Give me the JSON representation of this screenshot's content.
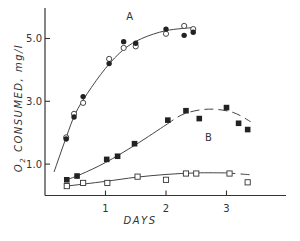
{
  "chart_data": {
    "type": "scatter",
    "title": "",
    "xlabel": "DAYS",
    "ylabel": "O2 CONSUMED, mg/l",
    "ylabel_parts": {
      "o": "O",
      "sub": "2",
      "rest": " CONSUMED,  mg/l"
    },
    "xlim": [
      0,
      4
    ],
    "ylim": [
      0,
      6
    ],
    "xticks": [
      1,
      2,
      3
    ],
    "xtick_labels": [
      "1",
      "2",
      "3"
    ],
    "yticks": [
      1.0,
      3.0,
      5.0
    ],
    "ytick_labels": [
      "1.0",
      "3.0",
      "5.0"
    ],
    "grid": false,
    "legend": "none",
    "annotations": [
      {
        "text": "A",
        "x": 1.4,
        "y": 5.6
      },
      {
        "text": "B",
        "x": 2.7,
        "y": 1.75
      }
    ],
    "series": [
      {
        "name": "A (open circles)",
        "marker": "open-circle",
        "points": [
          [
            0.35,
            1.85
          ],
          [
            0.48,
            2.6
          ],
          [
            0.63,
            2.95
          ],
          [
            1.06,
            4.35
          ],
          [
            1.3,
            4.7
          ],
          [
            1.5,
            4.75
          ],
          [
            2.0,
            5.15
          ],
          [
            2.3,
            5.4
          ],
          [
            2.45,
            5.3
          ]
        ]
      },
      {
        "name": "A (filled circles)",
        "marker": "filled-circle",
        "points": [
          [
            0.35,
            1.8
          ],
          [
            0.48,
            2.5
          ],
          [
            0.63,
            3.15
          ],
          [
            1.06,
            4.2
          ],
          [
            1.3,
            4.9
          ],
          [
            1.5,
            4.85
          ],
          [
            2.0,
            5.3
          ],
          [
            2.3,
            5.1
          ],
          [
            2.45,
            5.2
          ]
        ]
      },
      {
        "name": "B (filled squares)",
        "marker": "filled-square",
        "points": [
          [
            0.36,
            0.5
          ],
          [
            0.53,
            0.62
          ],
          [
            1.02,
            1.15
          ],
          [
            1.2,
            1.25
          ],
          [
            1.48,
            1.65
          ],
          [
            2.03,
            2.4
          ],
          [
            2.33,
            2.7
          ],
          [
            2.55,
            2.45
          ],
          [
            3.0,
            2.8
          ],
          [
            3.2,
            2.3
          ],
          [
            3.35,
            2.1
          ]
        ]
      },
      {
        "name": "C (open squares)",
        "marker": "open-square",
        "points": [
          [
            0.36,
            0.3
          ],
          [
            0.63,
            0.4
          ],
          [
            1.03,
            0.4
          ],
          [
            1.53,
            0.6
          ],
          [
            2.0,
            0.5
          ],
          [
            2.33,
            0.7
          ],
          [
            2.5,
            0.7
          ],
          [
            3.05,
            0.7
          ],
          [
            3.35,
            0.42
          ]
        ]
      }
    ],
    "fitted_curves": [
      {
        "name": "A",
        "style": "solid",
        "points": [
          [
            0.15,
            0.75
          ],
          [
            0.35,
            1.85
          ],
          [
            0.5,
            2.6
          ],
          [
            0.7,
            3.25
          ],
          [
            1.0,
            4.05
          ],
          [
            1.3,
            4.65
          ],
          [
            1.6,
            5.0
          ],
          [
            2.0,
            5.25
          ],
          [
            2.45,
            5.35
          ]
        ]
      },
      {
        "name": "B",
        "style": "solid-then-dashed",
        "dash_from_x": 2.2,
        "points": [
          [
            0.36,
            0.5
          ],
          [
            0.6,
            0.68
          ],
          [
            1.0,
            1.05
          ],
          [
            1.5,
            1.62
          ],
          [
            2.0,
            2.25
          ],
          [
            2.3,
            2.6
          ],
          [
            2.7,
            2.75
          ],
          [
            3.1,
            2.65
          ],
          [
            3.4,
            2.35
          ]
        ]
      },
      {
        "name": "C",
        "style": "solid-then-dashed",
        "dash_from_x": 3.05,
        "points": [
          [
            0.36,
            0.3
          ],
          [
            1.0,
            0.45
          ],
          [
            1.5,
            0.58
          ],
          [
            2.0,
            0.67
          ],
          [
            2.5,
            0.72
          ],
          [
            3.0,
            0.72
          ],
          [
            3.4,
            0.66
          ]
        ]
      }
    ]
  }
}
